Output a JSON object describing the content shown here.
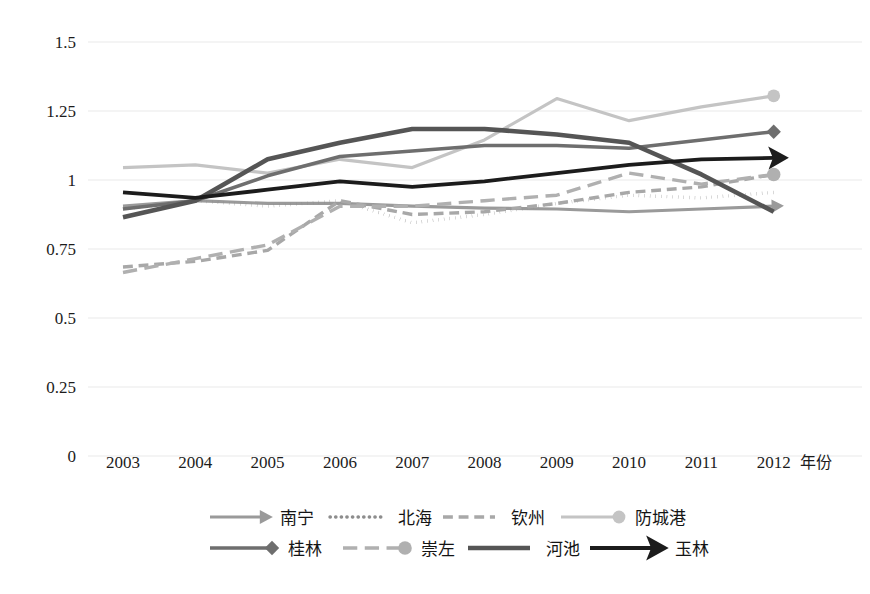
{
  "chart_data": {
    "type": "line",
    "title": "",
    "xlabel": "年份",
    "ylabel": "",
    "categories": [
      "2003",
      "2004",
      "2005",
      "2006",
      "2007",
      "2008",
      "2009",
      "2010",
      "2011",
      "2012"
    ],
    "x": [
      2003,
      2004,
      2005,
      2006,
      2007,
      2008,
      2009,
      2010,
      2011,
      2012
    ],
    "ylim": [
      0,
      1.5
    ],
    "yticks": [
      "0",
      "0.25",
      "0.5",
      "0.75",
      "1",
      "1.25",
      "1.5"
    ],
    "ytick_values": [
      0,
      0.25,
      0.5,
      0.75,
      1,
      1.25,
      1.5
    ],
    "grid": true,
    "legend_position": "bottom",
    "series": [
      {
        "name": "南宁",
        "style": "solid-arrow",
        "color": "#9a9a9a",
        "width": 3.2,
        "marker": "arrow",
        "values": [
          0.905,
          0.925,
          0.915,
          0.915,
          0.905,
          0.898,
          0.895,
          0.885,
          0.895,
          0.905
        ]
      },
      {
        "name": "北海",
        "style": "dotted",
        "color": "#8d8d8d",
        "width": 3.4,
        "marker": "none",
        "values": [
          0.895,
          0.925,
          0.905,
          0.925,
          0.845,
          0.875,
          0.915,
          0.945,
          0.935,
          0.955
        ]
      },
      {
        "name": "钦州",
        "style": "dashed",
        "color": "#a8a8a8",
        "width": 3.4,
        "marker": "none",
        "values": [
          0.685,
          0.705,
          0.745,
          0.925,
          0.875,
          0.885,
          0.915,
          0.955,
          0.975,
          1.02
        ]
      },
      {
        "name": "防城港",
        "style": "solid-circle",
        "color": "#c4c4c4",
        "width": 3.2,
        "marker": "circle",
        "values": [
          1.045,
          1.055,
          1.025,
          1.075,
          1.045,
          1.145,
          1.295,
          1.215,
          1.265,
          1.305
        ]
      },
      {
        "name": "桂林",
        "style": "solid-diamond",
        "color": "#6e6e6e",
        "width": 3.6,
        "marker": "diamond",
        "values": [
          0.895,
          0.925,
          1.015,
          1.085,
          1.105,
          1.125,
          1.125,
          1.115,
          1.145,
          1.175
        ]
      },
      {
        "name": "崇左",
        "style": "long-dash-circle",
        "color": "#b0b0b0",
        "width": 3.4,
        "marker": "circle",
        "values": [
          0.665,
          0.715,
          0.765,
          0.905,
          0.905,
          0.925,
          0.945,
          1.025,
          0.985,
          1.02
        ]
      },
      {
        "name": "河池",
        "style": "thick-solid",
        "color": "#555555",
        "width": 4.6,
        "marker": "none",
        "values": [
          0.865,
          0.925,
          1.075,
          1.135,
          1.185,
          1.185,
          1.165,
          1.135,
          1.02,
          0.885
        ]
      },
      {
        "name": "玉林",
        "style": "solid-bigarrow",
        "color": "#1c1c1c",
        "width": 3.8,
        "marker": "bigarrow",
        "values": [
          0.955,
          0.935,
          0.965,
          0.995,
          0.975,
          0.995,
          1.025,
          1.055,
          1.075,
          1.08
        ]
      }
    ]
  },
  "legend": {
    "rows": [
      [
        "南宁",
        "北海",
        "钦州",
        "防城港"
      ],
      [
        "桂林",
        "崇左",
        "河池",
        "玉林"
      ]
    ]
  },
  "axis": {
    "x_title": "年份"
  }
}
